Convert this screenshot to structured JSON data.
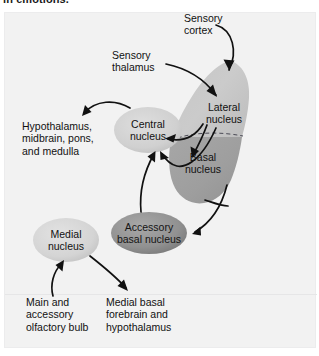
{
  "heading": {
    "text": "in emotions."
  },
  "figure": {
    "background_color": "#f2f2f2",
    "stroke_color": "#111111"
  },
  "colors": {
    "amygdala_lateral": "#c9c9c9",
    "amygdala_basal": "#a3a3a3",
    "central_nucleus_fill": "#d2d2d2",
    "medial_nucleus_fill": "#d6d6d6",
    "accessory_basal_fill": "#8f8f8f",
    "arrow": "#111111",
    "dashed_divider": "#4a4a55"
  },
  "structures": [
    {
      "id": "amygdala-shape",
      "name": "amygdala-outline",
      "label": "",
      "kind": "region"
    },
    {
      "id": "lateral-nucleus",
      "name": "lateral-nucleus",
      "label": "Lateral\nnucleus",
      "kind": "region-label",
      "x": 196,
      "y": 108
    },
    {
      "id": "basal-nucleus",
      "name": "basal-nucleus",
      "label": "Basal\nnucleus",
      "kind": "region-label",
      "x": 186,
      "y": 157
    },
    {
      "id": "central-nucleus",
      "name": "central-nucleus",
      "label": "Central\nnucleus",
      "kind": "ellipse",
      "cx": 148,
      "cy": 130,
      "rx": 34,
      "ry": 23
    },
    {
      "id": "medial-nucleus",
      "name": "medial-nucleus",
      "label": "Medial\nnucleus",
      "kind": "ellipse",
      "cx": 66,
      "cy": 240,
      "rx": 33,
      "ry": 22
    },
    {
      "id": "accessory-basal-nucleus",
      "name": "accessory-basal-nucleus",
      "label": "Accessory\nbasal nucleus",
      "kind": "ellipse",
      "cx": 149,
      "cy": 233,
      "rx": 38,
      "ry": 21
    }
  ],
  "annotations": [
    {
      "id": "sensory-cortex",
      "name": "sensory-cortex-label",
      "label": "Sensory\ncortex",
      "x": 184,
      "y": 18,
      "align": "left"
    },
    {
      "id": "sensory-thalamus",
      "name": "sensory-thalamus-label",
      "label": "Sensory\nthalamus",
      "x": 131,
      "y": 55,
      "align": "left"
    },
    {
      "id": "hypothalamus-midbrain",
      "name": "hypothalamus-midbrain-pons-medulla-label",
      "label": "Hypothalamus,\nmidbrain, pons,\nand medulla",
      "x": 30,
      "y": 129,
      "align": "left"
    },
    {
      "id": "olfactory-bulb",
      "name": "main-accessory-olfactory-bulb-label",
      "label": "Main and\naccessory\nolfactory bulb",
      "x": 31,
      "y": 301,
      "align": "left"
    },
    {
      "id": "medial-basal-forebrain",
      "name": "medial-basal-forebrain-hypothalamus-label",
      "label": "Medial basal\nforebrain and\nhypothalamus",
      "x": 110,
      "y": 301,
      "align": "left"
    }
  ],
  "connections": [
    {
      "id": "c1",
      "name": "sensory-cortex-to-lateral-nucleus",
      "from": "sensory-cortex",
      "to": "lateral-nucleus"
    },
    {
      "id": "c2",
      "name": "sensory-thalamus-to-lateral-nucleus",
      "from": "sensory-thalamus",
      "to": "lateral-nucleus"
    },
    {
      "id": "c3",
      "name": "lateral-nucleus-to-basal-nucleus",
      "from": "lateral-nucleus",
      "to": "basal-nucleus"
    },
    {
      "id": "c4",
      "name": "lateral-nucleus-to-central-nucleus",
      "from": "lateral-nucleus",
      "to": "central-nucleus"
    },
    {
      "id": "c5",
      "name": "basal-nucleus-to-central-nucleus",
      "from": "basal-nucleus",
      "to": "central-nucleus"
    },
    {
      "id": "c6",
      "name": "accessory-basal-nucleus-to-central-nucleus",
      "from": "accessory-basal-nucleus",
      "to": "central-nucleus"
    },
    {
      "id": "c7",
      "name": "amygdala-to-accessory-basal-nucleus",
      "from": "basal-nucleus",
      "to": "accessory-basal-nucleus"
    },
    {
      "id": "c8",
      "name": "central-nucleus-to-hypothalamus-midbrain",
      "from": "central-nucleus",
      "to": "hypothalamus-midbrain"
    },
    {
      "id": "c9",
      "name": "olfactory-bulb-to-medial-nucleus",
      "from": "olfactory-bulb",
      "to": "medial-nucleus"
    },
    {
      "id": "c10",
      "name": "medial-nucleus-to-medial-basal-forebrain",
      "from": "medial-nucleus",
      "to": "medial-basal-forebrain"
    }
  ]
}
